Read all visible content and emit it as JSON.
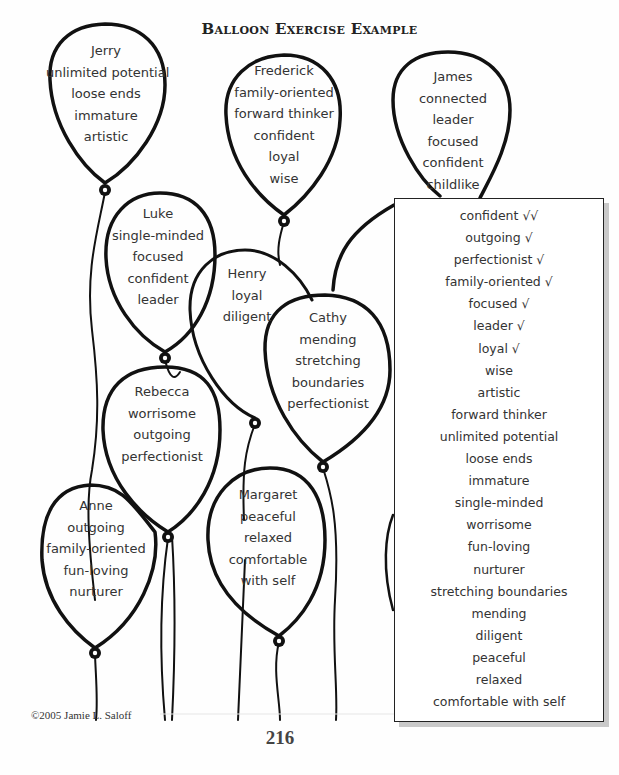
{
  "document": {
    "title": "Balloon Exercise Example",
    "copyright": "©2005  Jamie L. Saloff",
    "page_number": "216"
  },
  "balloons": [
    {
      "name": "Jerry",
      "traits": [
        "unlimited potential",
        "loose ends",
        "immature",
        "artistic"
      ]
    },
    {
      "name": "Frederick",
      "traits": [
        "family-oriented",
        "forward thinker",
        "confident",
        "loyal",
        "wise"
      ]
    },
    {
      "name": "James",
      "traits": [
        "connected",
        "leader",
        "focused",
        "confident",
        "childlike"
      ]
    },
    {
      "name": "Luke",
      "traits": [
        "single-minded",
        "focused",
        "confident",
        "leader"
      ]
    },
    {
      "name": "Henry",
      "traits": [
        "loyal",
        "diligent"
      ]
    },
    {
      "name": "Cathy",
      "traits": [
        "mending",
        "stretching",
        "boundaries",
        "perfectionist"
      ]
    },
    {
      "name": "Rebecca",
      "traits": [
        "worrisome",
        "outgoing",
        "perfectionist"
      ]
    },
    {
      "name": "Anne",
      "traits": [
        "outgoing",
        "family-oriented",
        "fun-loving",
        "nurturer"
      ]
    },
    {
      "name": "Margaret",
      "traits": [
        "peaceful",
        "relaxed",
        "comfortable",
        "with self"
      ]
    }
  ],
  "summary_list": {
    "items": [
      "confident √√",
      "outgoing √",
      "perfectionist √",
      "family-oriented √",
      "focused √",
      "leader √",
      "loyal √",
      "wise",
      "artistic",
      "forward thinker",
      "unlimited potential",
      "loose ends",
      "immature",
      "single-minded",
      "worrisome",
      "fun-loving",
      "nurturer",
      "stretching boundaries",
      "mending",
      "diligent",
      "peaceful",
      "relaxed",
      "comfortable with self"
    ]
  },
  "colors": {
    "ink": "#111111",
    "text": "#333333",
    "shadow": "#c9c9c9"
  }
}
